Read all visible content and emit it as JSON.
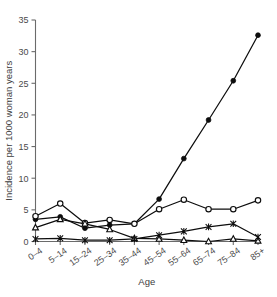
{
  "chart_data": {
    "type": "line",
    "title": "",
    "subtitle": "",
    "xlabel": "Age",
    "ylabel": "Incidence per 1000 woman years",
    "categories": [
      "0–4",
      "5–14",
      "15–24",
      "25–34",
      "35–44",
      "45–54",
      "55–64",
      "65–74",
      "75–84",
      "85+"
    ],
    "x_tick_labels": [
      "0–4",
      "5–14",
      "15–24",
      "25–34",
      "35–44",
      "45–54",
      "55–64",
      "65–74",
      "75–84",
      "85+"
    ],
    "y_tick_labels": [
      "0",
      "5",
      "10",
      "15",
      "20",
      "25",
      "30",
      "35"
    ],
    "y_ticks": [
      0,
      5,
      10,
      15,
      20,
      25,
      30,
      35
    ],
    "ylim": [
      0,
      35
    ],
    "xlim": [
      0,
      9
    ],
    "grid": false,
    "legend": "none",
    "legend_position": "none",
    "series": [
      {
        "name": "series-filled-circle",
        "marker": "filled-circle",
        "color": "#0d0d0d",
        "values": [
          3.5,
          3.9,
          2.1,
          2.6,
          2.8,
          6.7,
          13.1,
          19.2,
          25.4,
          32.6
        ]
      },
      {
        "name": "series-open-circle",
        "marker": "open-circle",
        "color": "#0d0d0d",
        "values": [
          4.0,
          6.0,
          2.9,
          3.4,
          2.8,
          5.1,
          6.6,
          5.1,
          5.1,
          6.5
        ]
      },
      {
        "name": "series-open-triangle",
        "marker": "open-triangle",
        "color": "#0d0d0d",
        "values": [
          2.2,
          3.5,
          2.8,
          1.9,
          0.5,
          0.4,
          0.2,
          0.0,
          0.4,
          0.1
        ]
      },
      {
        "name": "series-asterisk",
        "marker": "asterisk",
        "color": "#0d0d0d",
        "values": [
          0.4,
          0.5,
          0.2,
          0.2,
          0.4,
          1.0,
          1.6,
          2.3,
          2.8,
          0.7
        ]
      }
    ]
  },
  "axes": {
    "x_title": "Age",
    "y_title": "Incidence per 1000 woman years"
  },
  "colors": {
    "ink": "#0d0d0d",
    "axis": "#6b6b6b",
    "background": "#ffffff"
  }
}
